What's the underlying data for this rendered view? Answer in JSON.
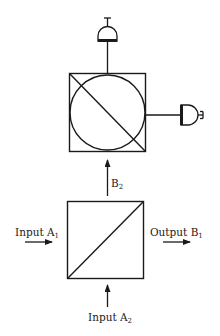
{
  "diagram": {
    "colors": {
      "stroke": "#1a1a1a",
      "background": "#ffffff"
    },
    "labels": {
      "input_a1": {
        "text": "Input A",
        "sub": "1"
      },
      "input_a2": {
        "text": "Input A",
        "sub": "2"
      },
      "output_b1": {
        "text": "Output B",
        "sub": "1"
      },
      "b2": {
        "text": "B",
        "sub": "2"
      }
    },
    "components": [
      {
        "id": "beam-splitter",
        "shape": "square with diagonal"
      },
      {
        "id": "circle-splitter",
        "shape": "square with circle and diagonal"
      },
      {
        "id": "detector-top",
        "shape": "detector"
      },
      {
        "id": "detector-right",
        "shape": "detector"
      }
    ]
  }
}
